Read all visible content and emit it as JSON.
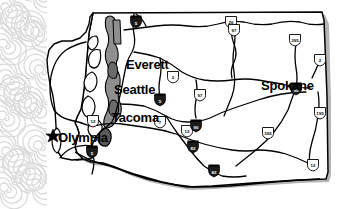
{
  "map": {
    "title": "Washington State Highway Map",
    "subject": "Washington",
    "background_color": "#ffffff",
    "land_fill": "#ffffff",
    "outline_color": "#000000",
    "water_fill": "#9a9a9a",
    "shadow_color": "#a8a8a8",
    "road_color": "#000000",
    "decor": {
      "name": "spiral-pattern",
      "color": "#d8d8d8",
      "region": "left-edge"
    }
  },
  "cities": [
    {
      "name": "Everett",
      "x": 126,
      "y": 58,
      "font_size": 13,
      "marker": "none"
    },
    {
      "name": "Seattle",
      "x": 114,
      "y": 83,
      "font_size": 13,
      "marker": "none"
    },
    {
      "name": "Tacoma",
      "x": 112,
      "y": 111,
      "font_size": 13,
      "marker": "none"
    },
    {
      "name": "Olympia",
      "x": 58,
      "y": 131,
      "font_size": 13,
      "marker": "star"
    },
    {
      "name": "Spokane",
      "x": 261,
      "y": 79,
      "font_size": 13,
      "marker": "none"
    }
  ],
  "shields": [
    {
      "label": "5",
      "type": "interstate",
      "x": 136,
      "y": 22
    },
    {
      "label": "20",
      "type": "us",
      "x": 231,
      "y": 22
    },
    {
      "label": "97",
      "type": "us",
      "x": 234,
      "y": 30
    },
    {
      "label": "395",
      "type": "us",
      "x": 295,
      "y": 40
    },
    {
      "label": "2",
      "type": "us",
      "x": 173,
      "y": 77
    },
    {
      "label": "2",
      "type": "us",
      "x": 320,
      "y": 60
    },
    {
      "label": "90",
      "type": "interstate",
      "x": 296,
      "y": 89
    },
    {
      "label": "5",
      "type": "interstate",
      "x": 160,
      "y": 100
    },
    {
      "label": "97",
      "type": "us",
      "x": 200,
      "y": 95
    },
    {
      "label": "12",
      "type": "us",
      "x": 93,
      "y": 121
    },
    {
      "label": "7",
      "type": "us",
      "x": 160,
      "y": 122
    },
    {
      "label": "12",
      "type": "us",
      "x": 187,
      "y": 131
    },
    {
      "label": "90",
      "type": "interstate",
      "x": 196,
      "y": 126
    },
    {
      "label": "82",
      "type": "interstate",
      "x": 193,
      "y": 147
    },
    {
      "label": "5",
      "type": "interstate",
      "x": 92,
      "y": 152
    },
    {
      "label": "395",
      "type": "us",
      "x": 268,
      "y": 133
    },
    {
      "label": "195",
      "type": "us",
      "x": 320,
      "y": 113
    },
    {
      "label": "12",
      "type": "us",
      "x": 313,
      "y": 165
    },
    {
      "label": "82",
      "type": "interstate",
      "x": 214,
      "y": 171
    }
  ],
  "legend": {
    "capital_marker": "star",
    "capital_city": "Olympia"
  }
}
